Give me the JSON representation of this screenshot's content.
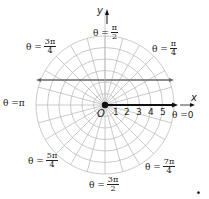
{
  "diagram": {
    "center": {
      "x": 105,
      "y": 105
    },
    "ring_count": 6,
    "ring_spacing_px": 11.5,
    "ray_count": 24,
    "grid_color": "#bdbdbd",
    "line_color": "#666666",
    "axis_color": "#111111"
  },
  "axes": {
    "x_label": "x",
    "y_label": "y",
    "origin_label": "O"
  },
  "ticks": [
    "1",
    "2",
    "3",
    "4",
    "5"
  ],
  "angle_labels": {
    "a0": {
      "prefix": "θ = ",
      "value": "0"
    },
    "a_pi4": {
      "prefix": "θ = ",
      "num": "π",
      "den": "4"
    },
    "a_pi2": {
      "prefix": "θ = ",
      "num": "π",
      "den": "2"
    },
    "a_3pi4": {
      "prefix": "θ = ",
      "num": "3π",
      "den": "4"
    },
    "a_pi": {
      "prefix": "θ = ",
      "value": "π"
    },
    "a_5pi4": {
      "prefix": "θ = ",
      "num": "5π",
      "den": "4"
    },
    "a_3pi2": {
      "prefix": "θ = ",
      "num": "3π",
      "den": "2"
    },
    "a_7pi4": {
      "prefix": "θ = ",
      "num": "7π",
      "den": "4"
    }
  },
  "trailing_mark": "."
}
